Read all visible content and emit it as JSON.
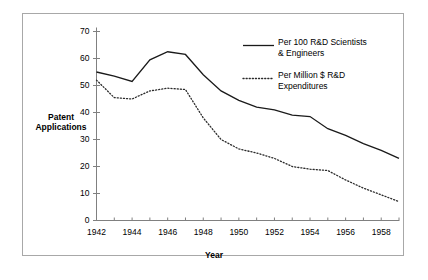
{
  "chart_data": {
    "type": "line",
    "title": "",
    "xlabel": "Year",
    "ylabel": "Patent Applications",
    "xlim": [
      1942,
      1959
    ],
    "ylim": [
      0,
      70
    ],
    "yticks": [
      0,
      10,
      20,
      30,
      40,
      50,
      60,
      70
    ],
    "xticks": [
      1942,
      1943,
      1944,
      1945,
      1946,
      1947,
      1948,
      1949,
      1950,
      1951,
      1952,
      1953,
      1954,
      1955,
      1956,
      1957,
      1958,
      1959
    ],
    "xticklabels": [
      "1942",
      "",
      "1944",
      "",
      "1946",
      "",
      "1948",
      "",
      "1950",
      "",
      "1952",
      "",
      "1954",
      "",
      "1956",
      "",
      "1958",
      ""
    ],
    "yticklabels": [
      "0",
      "10",
      "20",
      "30",
      "40",
      "50",
      "60",
      "70"
    ],
    "grid": false,
    "legend_position": "upper right",
    "x": [
      1942,
      1943,
      1944,
      1945,
      1946,
      1947,
      1948,
      1949,
      1950,
      1951,
      1952,
      1953,
      1954,
      1955,
      1956,
      1957,
      1958,
      1959
    ],
    "series": [
      {
        "name": "Per 100 R&D Scientists & Engineers",
        "style": "solid",
        "color": "#1a1a1a",
        "values": [
          55.0,
          53.5,
          51.5,
          59.5,
          62.5,
          61.5,
          54.0,
          48.0,
          44.5,
          42.0,
          41.0,
          39.0,
          38.5,
          34.0,
          31.5,
          28.5,
          26.0,
          23.0
        ]
      },
      {
        "name": "Per Million $ R&D Expenditures",
        "style": "dotted",
        "color": "#2b2b2b",
        "values": [
          52.0,
          45.5,
          45.0,
          48.0,
          49.0,
          48.5,
          38.0,
          30.0,
          26.5,
          25.0,
          23.0,
          20.0,
          19.0,
          18.5,
          15.0,
          12.0,
          9.5,
          7.0
        ]
      }
    ]
  },
  "axis": {
    "ytitle_line1": "Patent",
    "ytitle_line2": "Applications",
    "xtitle": "Year"
  },
  "legend": {
    "entries": [
      {
        "line1": "Per 100 R&D Scientists",
        "line2": "& Engineers",
        "style": "solid"
      },
      {
        "line1": "Per Million $ R&D",
        "line2": "Expenditures",
        "style": "dotted"
      }
    ]
  },
  "style": {
    "border_color": "#a8a8a8",
    "axis_color": "#808080",
    "series1_color": "#1a1a1a",
    "series2_color": "#2b2b2b",
    "background": "#ffffff"
  }
}
